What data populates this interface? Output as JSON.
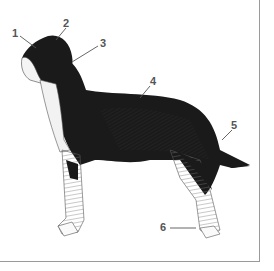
{
  "figure": {
    "callouts": [
      {
        "number": "1",
        "x": 12,
        "y": 28
      },
      {
        "number": "2",
        "x": 63,
        "y": 18
      },
      {
        "number": "3",
        "x": 100,
        "y": 38
      },
      {
        "number": "4",
        "x": 150,
        "y": 76
      },
      {
        "number": "5",
        "x": 231,
        "y": 120
      },
      {
        "number": "6",
        "x": 160,
        "y": 222
      }
    ]
  }
}
